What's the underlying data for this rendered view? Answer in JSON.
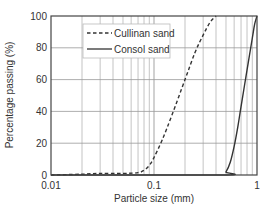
{
  "chart_data": {
    "type": "line",
    "title": "",
    "xlabel": "Particle size (mm)",
    "ylabel": "Percentage passing (%)",
    "xscale": "log",
    "xlim": [
      0.01,
      1
    ],
    "ylim": [
      0,
      100
    ],
    "x_ticks": [
      {
        "value": 0.01,
        "label": "0.01"
      },
      {
        "value": 0.1,
        "label": "0.1"
      },
      {
        "value": 1,
        "label": "1"
      }
    ],
    "y_ticks": [
      {
        "value": 0,
        "label": "0"
      },
      {
        "value": 20,
        "label": "20"
      },
      {
        "value": 40,
        "label": "40"
      },
      {
        "value": 60,
        "label": "60"
      },
      {
        "value": 80,
        "label": "80"
      },
      {
        "value": 100,
        "label": "100"
      }
    ],
    "grid": true,
    "legend_position": "upper-left",
    "series": [
      {
        "name": "Cullinan sand",
        "style": "dashed",
        "color": "#333333",
        "points": [
          [
            0.01,
            0
          ],
          [
            0.02,
            0.5
          ],
          [
            0.03,
            1
          ],
          [
            0.05,
            1
          ],
          [
            0.07,
            1.5
          ],
          [
            0.08,
            3
          ],
          [
            0.09,
            6
          ],
          [
            0.1,
            11
          ],
          [
            0.12,
            22
          ],
          [
            0.15,
            38
          ],
          [
            0.2,
            60
          ],
          [
            0.25,
            77
          ],
          [
            0.3,
            88
          ],
          [
            0.35,
            96
          ],
          [
            0.4,
            100
          ]
        ]
      },
      {
        "name": "Consol sand",
        "style": "solid",
        "color": "#333333",
        "points": [
          [
            0.01,
            0
          ],
          [
            0.45,
            0
          ],
          [
            0.5,
            2
          ],
          [
            0.55,
            8
          ],
          [
            0.6,
            18
          ],
          [
            0.65,
            30
          ],
          [
            0.7,
            43
          ],
          [
            0.8,
            66
          ],
          [
            0.9,
            86
          ],
          [
            0.95,
            95
          ],
          [
            1.0,
            100
          ]
        ]
      }
    ]
  },
  "legend": {
    "items": [
      {
        "label": "Cullinan sand",
        "style": "dashed"
      },
      {
        "label": "Consol sand",
        "style": "solid"
      }
    ]
  }
}
